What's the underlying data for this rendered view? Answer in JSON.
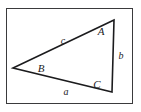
{
  "figure": {
    "kind": "geometry-diagram",
    "background_color": "#ffffff",
    "frame": {
      "name": "diagram-border",
      "color": "#3a3a3c",
      "x": 6,
      "y": 8,
      "width": 127,
      "height": 96
    },
    "stroke_color": "#1b1b1d",
    "text_color": "#1b1b1d"
  },
  "chart_data": {
    "type": "diagram",
    "title": "",
    "vertices": [
      {
        "id": "A",
        "label": "A",
        "x": 114,
        "y": 20,
        "label_x": 101,
        "label_y": 35
      },
      {
        "id": "B",
        "label": "B",
        "x": 13,
        "y": 68,
        "label_x": 41,
        "label_y": 72
      },
      {
        "id": "C",
        "label": "C",
        "x": 112,
        "y": 92,
        "label_x": 97,
        "label_y": 88
      }
    ],
    "sides": [
      {
        "id": "a",
        "label": "a",
        "from": "B",
        "to": "C",
        "label_x": 66,
        "label_y": 95
      },
      {
        "id": "b",
        "label": "b",
        "from": "A",
        "to": "C",
        "label_x": 121,
        "label_y": 59
      },
      {
        "id": "c",
        "label": "c",
        "from": "A",
        "to": "B",
        "label_x": 63,
        "label_y": 44
      }
    ]
  }
}
